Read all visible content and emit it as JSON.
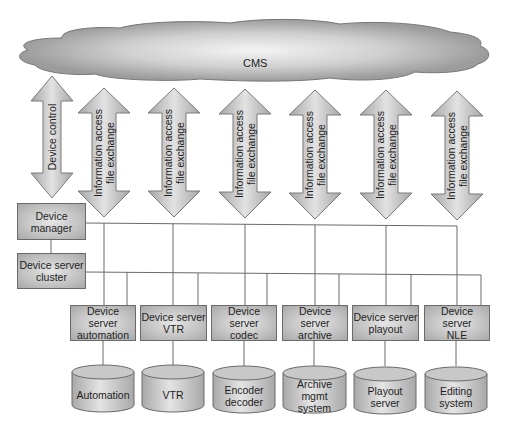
{
  "diagram": {
    "cloud": {
      "label": "CMS"
    },
    "arrows": {
      "device_control": {
        "label": "Device control"
      },
      "info": [
        {
          "line1": "Information access",
          "line2": "file exchange"
        },
        {
          "line1": "Information access",
          "line2": "file exchange"
        },
        {
          "line1": "Information access",
          "line2": "file exchange"
        },
        {
          "line1": "Information access",
          "line2": "file exchange"
        },
        {
          "line1": "Information access",
          "line2": "file exchange"
        },
        {
          "line1": "Information access",
          "line2": "file exchange"
        }
      ]
    },
    "device_manager": {
      "line1": "Device",
      "line2": "manager"
    },
    "device_server_cluster": {
      "line1": "Device server",
      "line2": "cluster"
    },
    "device_servers": [
      {
        "line1": "Device server",
        "line2": "automation"
      },
      {
        "line1": "Device server",
        "line2": "VTR"
      },
      {
        "line1": "Device server",
        "line2": "codec"
      },
      {
        "line1": "Device server",
        "line2": "archive"
      },
      {
        "line1": "Device server",
        "line2": "playout"
      },
      {
        "line1": "Device server",
        "line2": "NLE"
      }
    ],
    "systems": [
      {
        "line1": "Automation",
        "line2": ""
      },
      {
        "line1": "VTR",
        "line2": ""
      },
      {
        "line1": "Encoder",
        "line2": "decoder"
      },
      {
        "line1": "Archive mgmt",
        "line2": "system"
      },
      {
        "line1": "Playout",
        "line2": "server"
      },
      {
        "line1": "Editing",
        "line2": "system"
      }
    ],
    "colors": {
      "box_fill": "#c2c2c2",
      "box_border": "#6a6a6a",
      "line": "#6a6a6a",
      "arrow_fill": "#b8b8b8",
      "cloud_fill": "#a9a9a9"
    }
  }
}
